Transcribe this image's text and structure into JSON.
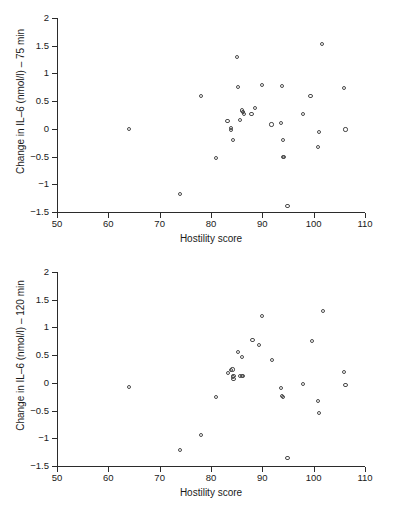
{
  "figure": {
    "background": "#ffffff",
    "marker_color": "#4a4a4a",
    "axis_color": "#2b2b2b"
  },
  "chart_data": [
    {
      "type": "scatter",
      "panel": "top",
      "title": "",
      "xlabel": "Hostility score",
      "ylabel": "Change in IL–6 (nmol/l) – 75 min",
      "xlim": [
        50,
        110
      ],
      "ylim": [
        -1.5,
        2
      ],
      "xticks": [
        50,
        60,
        70,
        80,
        90,
        100,
        110
      ],
      "yticks": [
        -1.5,
        -1,
        -0.5,
        0,
        0.5,
        1,
        1.5,
        2
      ],
      "xtick_labels": [
        "50",
        "60",
        "70",
        "80",
        "90",
        "100",
        "110"
      ],
      "ytick_labels": [
        "−1.5",
        "−1",
        "−0.5",
        "0",
        "0.5",
        "1",
        "1.5",
        "2"
      ],
      "grid": false,
      "legend": false,
      "x": [
        64.0,
        73.9,
        78.0,
        80.9,
        83.2,
        83.9,
        83.9,
        84.3,
        85.1,
        85.2,
        85.6,
        86.0,
        86.2,
        86.2,
        86.4,
        87.9,
        88.6,
        89.9,
        91.8,
        93.6,
        93.8,
        94.0,
        94.0,
        94.2,
        94.9,
        97.9,
        99.4,
        100.8,
        101.0,
        101.6,
        105.9,
        106.2
      ],
      "y": [
        0.0,
        -1.17,
        0.6,
        -0.53,
        0.14,
        0.01,
        -0.02,
        -0.2,
        1.3,
        0.75,
        0.16,
        0.33,
        0.3,
        0.31,
        0.27,
        0.27,
        0.38,
        0.79,
        0.08,
        0.1,
        0.77,
        -0.2,
        -0.51,
        -0.51,
        -1.39,
        0.27,
        0.6,
        -0.33,
        -0.06,
        1.53,
        0.73,
        -0.01
      ]
    },
    {
      "type": "scatter",
      "panel": "bottom",
      "title": "",
      "xlabel": "Hostility score",
      "ylabel": "Change in IL–6 (nmol/l) – 120 min",
      "xlim": [
        50,
        110
      ],
      "ylim": [
        -1.5,
        2
      ],
      "xticks": [
        50,
        60,
        70,
        80,
        90,
        100,
        110
      ],
      "yticks": [
        -1.5,
        -1,
        -0.5,
        0,
        0.5,
        1,
        1.5,
        2
      ],
      "xtick_labels": [
        "50",
        "60",
        "70",
        "80",
        "90",
        "100",
        "110"
      ],
      "ytick_labels": [
        "−1.5",
        "−1",
        "−0.5",
        "0",
        "0.5",
        "1",
        "1.5",
        "2"
      ],
      "grid": false,
      "legend": false,
      "x": [
        64.0,
        73.9,
        78.0,
        80.9,
        83.3,
        83.9,
        84.2,
        84.3,
        84.4,
        84.4,
        85.2,
        85.6,
        86.0,
        86.1,
        86.3,
        88.1,
        89.3,
        89.9,
        91.9,
        93.7,
        93.9,
        94.0,
        94.9,
        98.0,
        99.6,
        100.9,
        101.0,
        101.8,
        105.9,
        106.2
      ],
      "y": [
        -0.07,
        -1.21,
        -0.94,
        -0.25,
        0.18,
        0.23,
        0.24,
        0.1,
        0.07,
        0.12,
        0.56,
        0.13,
        0.47,
        0.13,
        0.13,
        0.78,
        0.68,
        1.21,
        0.41,
        -0.09,
        -0.24,
        -0.25,
        -1.35,
        -0.02,
        0.76,
        -0.33,
        -0.55,
        1.3,
        0.2,
        -0.04
      ]
    }
  ]
}
